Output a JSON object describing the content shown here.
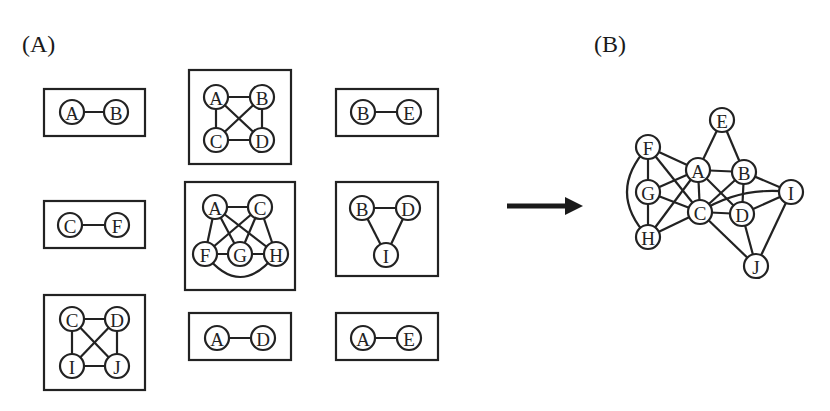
{
  "labels": {
    "panel_a": "(A)",
    "panel_b": "(B)"
  },
  "colors": {
    "stroke": "#222222",
    "background": "#ffffff"
  },
  "panel_a": {
    "subgraphs": [
      {
        "id": "AB",
        "box": [
          44,
          89,
          101,
          47
        ],
        "nodes": [
          {
            "id": "A",
            "x": 72,
            "y": 112
          },
          {
            "id": "B",
            "x": 116,
            "y": 112
          }
        ],
        "edges": [
          [
            "A",
            "B"
          ]
        ]
      },
      {
        "id": "ABCD",
        "box": [
          189,
          70,
          102,
          94
        ],
        "nodes": [
          {
            "id": "A",
            "x": 216,
            "y": 97
          },
          {
            "id": "B",
            "x": 262,
            "y": 97
          },
          {
            "id": "C",
            "x": 216,
            "y": 140
          },
          {
            "id": "D",
            "x": 262,
            "y": 140
          }
        ],
        "edges": [
          [
            "A",
            "B"
          ],
          [
            "A",
            "C"
          ],
          [
            "A",
            "D"
          ],
          [
            "B",
            "C"
          ],
          [
            "B",
            "D"
          ],
          [
            "C",
            "D"
          ]
        ]
      },
      {
        "id": "BE",
        "box": [
          336,
          89,
          102,
          47
        ],
        "nodes": [
          {
            "id": "B",
            "x": 363,
            "y": 112
          },
          {
            "id": "E",
            "x": 409,
            "y": 112
          }
        ],
        "edges": [
          [
            "B",
            "E"
          ]
        ]
      },
      {
        "id": "CF",
        "box": [
          44,
          201,
          101,
          47
        ],
        "nodes": [
          {
            "id": "C",
            "x": 70,
            "y": 225
          },
          {
            "id": "F",
            "x": 117,
            "y": 225
          }
        ],
        "edges": [
          [
            "C",
            "F"
          ]
        ]
      },
      {
        "id": "ACFGH",
        "box": [
          185,
          182,
          110,
          108
        ],
        "nodes": [
          {
            "id": "A",
            "x": 215,
            "y": 207
          },
          {
            "id": "C",
            "x": 260,
            "y": 207
          },
          {
            "id": "F",
            "x": 205,
            "y": 254
          },
          {
            "id": "G",
            "x": 240,
            "y": 254
          },
          {
            "id": "H",
            "x": 276,
            "y": 254
          }
        ],
        "edges": [
          [
            "A",
            "C"
          ],
          [
            "A",
            "F"
          ],
          [
            "A",
            "G"
          ],
          [
            "A",
            "H"
          ],
          [
            "C",
            "F"
          ],
          [
            "C",
            "G"
          ],
          [
            "C",
            "H"
          ],
          [
            "F",
            "G"
          ],
          [
            "G",
            "H"
          ]
        ],
        "curved_edges": [
          {
            "from": "F",
            "to": "H",
            "via": [
              240,
              300
            ]
          }
        ]
      },
      {
        "id": "BDI",
        "box": [
          336,
          182,
          102,
          94
        ],
        "nodes": [
          {
            "id": "B",
            "x": 362,
            "y": 208
          },
          {
            "id": "D",
            "x": 408,
            "y": 208
          },
          {
            "id": "I",
            "x": 386,
            "y": 255
          }
        ],
        "edges": [
          [
            "B",
            "D"
          ],
          [
            "B",
            "I"
          ],
          [
            "D",
            "I"
          ]
        ]
      },
      {
        "id": "CDIJ",
        "box": [
          44,
          295,
          101,
          95
        ],
        "nodes": [
          {
            "id": "C",
            "x": 72,
            "y": 319
          },
          {
            "id": "D",
            "x": 117,
            "y": 319
          },
          {
            "id": "I",
            "x": 72,
            "y": 366
          },
          {
            "id": "J",
            "x": 117,
            "y": 366
          }
        ],
        "edges": [
          [
            "C",
            "D"
          ],
          [
            "C",
            "I"
          ],
          [
            "C",
            "J"
          ],
          [
            "D",
            "I"
          ],
          [
            "D",
            "J"
          ],
          [
            "I",
            "J"
          ]
        ]
      },
      {
        "id": "AD",
        "box": [
          189,
          313,
          102,
          47
        ],
        "nodes": [
          {
            "id": "A",
            "x": 217,
            "y": 338
          },
          {
            "id": "D",
            "x": 263,
            "y": 338
          }
        ],
        "edges": [
          [
            "A",
            "D"
          ]
        ]
      },
      {
        "id": "AE",
        "box": [
          336,
          313,
          102,
          47
        ],
        "nodes": [
          {
            "id": "A",
            "x": 363,
            "y": 338
          },
          {
            "id": "E",
            "x": 409,
            "y": 338
          }
        ],
        "edges": [
          [
            "A",
            "E"
          ]
        ]
      }
    ]
  },
  "arrow": {
    "x1": 507,
    "y1": 206,
    "x2": 583,
    "y2": 206
  },
  "panel_b": {
    "nodes": [
      {
        "id": "E",
        "x": 722,
        "y": 120
      },
      {
        "id": "F",
        "x": 648,
        "y": 147
      },
      {
        "id": "A",
        "x": 698,
        "y": 170
      },
      {
        "id": "B",
        "x": 744,
        "y": 172
      },
      {
        "id": "G",
        "x": 648,
        "y": 192
      },
      {
        "id": "I",
        "x": 791,
        "y": 192
      },
      {
        "id": "C",
        "x": 700,
        "y": 212
      },
      {
        "id": "D",
        "x": 742,
        "y": 214
      },
      {
        "id": "H",
        "x": 648,
        "y": 237
      },
      {
        "id": "J",
        "x": 756,
        "y": 266
      }
    ],
    "edges": [
      [
        "A",
        "E"
      ],
      [
        "B",
        "E"
      ],
      [
        "A",
        "B"
      ],
      [
        "A",
        "C"
      ],
      [
        "A",
        "D"
      ],
      [
        "A",
        "F"
      ],
      [
        "A",
        "G"
      ],
      [
        "A",
        "H"
      ],
      [
        "B",
        "C"
      ],
      [
        "B",
        "D"
      ],
      [
        "B",
        "I"
      ],
      [
        "C",
        "D"
      ],
      [
        "C",
        "F"
      ],
      [
        "C",
        "G"
      ],
      [
        "C",
        "H"
      ],
      [
        "C",
        "J"
      ],
      [
        "D",
        "I"
      ],
      [
        "D",
        "J"
      ],
      [
        "I",
        "J"
      ],
      [
        "F",
        "G"
      ],
      [
        "G",
        "H"
      ]
    ],
    "curved_edges": [
      {
        "from": "F",
        "to": "H",
        "via": [
          606,
          192
        ]
      },
      {
        "from": "C",
        "to": "I",
        "via": [
          740,
          186
        ]
      }
    ]
  }
}
